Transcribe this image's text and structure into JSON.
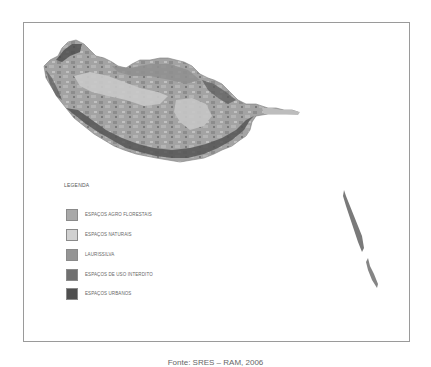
{
  "map": {
    "regions": [
      {
        "name": "Madeira",
        "role": "main-island"
      },
      {
        "name": "Desertas",
        "role": "eastern-islets"
      }
    ]
  },
  "legend": {
    "title": "LEGENDA",
    "items": [
      {
        "label": "ESPAÇOS AGRO FLORESTAIS",
        "color": "#a9a9a9"
      },
      {
        "label": "ESPAÇOS NATURAIS",
        "color": "#d0d0d0"
      },
      {
        "label": "LAURISSILVA",
        "color": "#959595"
      },
      {
        "label": "ESPAÇOS DE USO INTERDITO",
        "color": "#707070"
      },
      {
        "label": "ESPAÇOS URBANOS",
        "color": "#4f4f4f"
      }
    ]
  },
  "source": "Fonte: SRES – RAM, 2006"
}
